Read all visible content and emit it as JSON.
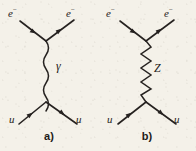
{
  "figure": {
    "type": "feynman-diagrams",
    "background_color": "#f4f1e9",
    "ink_color": "#262220",
    "panels": [
      {
        "caption": "a)",
        "propagator": {
          "particle_label": "γ",
          "line_style": "wavy",
          "name": "photon"
        },
        "incoming_upper": {
          "label": "e",
          "charge": "−"
        },
        "outgoing_upper": {
          "label": "e",
          "charge": "−"
        },
        "incoming_lower": {
          "label": "u",
          "charge": ""
        },
        "outgoing_lower": {
          "label": "u",
          "charge": ""
        }
      },
      {
        "caption": "b)",
        "propagator": {
          "particle_label": "Z",
          "line_style": "zigzag",
          "name": "z-boson"
        },
        "incoming_upper": {
          "label": "e",
          "charge": "−"
        },
        "outgoing_upper": {
          "label": "e",
          "charge": "−"
        },
        "incoming_lower": {
          "label": "u",
          "charge": ""
        },
        "outgoing_lower": {
          "label": "u",
          "charge": ""
        }
      }
    ]
  }
}
